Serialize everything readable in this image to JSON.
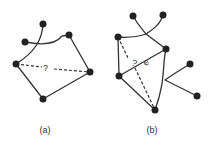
{
  "diagrams": [
    {
      "caption": "(a)",
      "edge_label": "?"
    },
    {
      "caption": "(b)",
      "edge_labels": [
        "?",
        "e"
      ]
    }
  ],
  "colors": {
    "node": "#222222",
    "edge": "#333333",
    "background": "#ffffff"
  }
}
